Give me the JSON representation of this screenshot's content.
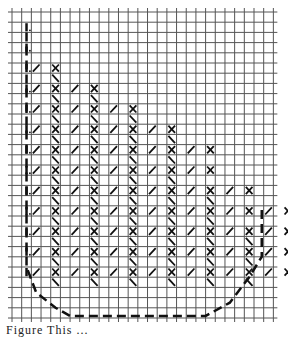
{
  "diagram": {
    "type": "needlepoint-stitch-chart",
    "grid": {
      "origin_x": 12,
      "origin_y": 12,
      "cell_w": 9.68,
      "cell_h": 10.2,
      "cols": 27,
      "rows": 30,
      "line_color": "#555555",
      "background": "#ffffff"
    },
    "stitch_color": "#111111",
    "dash_color": "#111111",
    "stitch_rows": [
      {
        "row": 5,
        "pattern": "/X",
        "start_col": 2,
        "pairs": 1
      },
      {
        "row": 6,
        "pattern": "\\",
        "cols": [
          4
        ]
      },
      {
        "row": 7,
        "pattern": "/X",
        "start_col": 2,
        "pairs": 2
      },
      {
        "row": 8,
        "pattern": "\\",
        "cols": [
          4,
          8
        ]
      },
      {
        "row": 9,
        "pattern": "/X",
        "start_col": 2,
        "pairs": 3
      },
      {
        "row": 10,
        "pattern": "\\",
        "cols": [
          4,
          8,
          12
        ]
      },
      {
        "row": 11,
        "pattern": "/X",
        "start_col": 2,
        "pairs": 4
      },
      {
        "row": 12,
        "pattern": "\\",
        "cols": [
          4,
          8,
          12,
          16
        ]
      },
      {
        "row": 13,
        "pattern": "/X",
        "start_col": 2,
        "pairs": 5
      },
      {
        "row": 14,
        "pattern": "\\",
        "cols": [
          4,
          8,
          12,
          16
        ]
      },
      {
        "row": 15,
        "pattern": "/X",
        "start_col": 2,
        "pairs": 5
      },
      {
        "row": 16,
        "pattern": "\\",
        "cols": [
          4,
          8,
          12,
          16
        ]
      },
      {
        "row": 17,
        "pattern": "/X",
        "start_col": 2,
        "pairs": 6
      },
      {
        "row": 18,
        "pattern": "\\",
        "cols": [
          4,
          8,
          12,
          16,
          20
        ]
      },
      {
        "row": 19,
        "pattern": "/X",
        "start_col": 2,
        "pairs": 7
      },
      {
        "row": 20,
        "pattern": "\\",
        "cols": [
          4,
          8,
          12,
          16,
          20
        ]
      },
      {
        "row": 21,
        "pattern": "/X",
        "start_col": 2,
        "pairs": 8
      },
      {
        "row": 22,
        "pattern": "\\",
        "cols": [
          4,
          8,
          12,
          16,
          20,
          24
        ]
      },
      {
        "row": 23,
        "pattern": "/X",
        "start_col": 2,
        "pairs": 9
      },
      {
        "row": 24,
        "pattern": "\\",
        "cols": [
          4,
          8,
          12,
          16,
          20,
          24
        ]
      },
      {
        "row": 25,
        "pattern": "/X",
        "start_col": 2,
        "pairs": 9
      },
      {
        "row": 26,
        "pattern": "\\",
        "cols": [
          4,
          8,
          12,
          16,
          20,
          24
        ]
      }
    ],
    "left_edge_marks_rows": [
      1,
      3,
      5,
      7,
      9,
      11,
      13,
      15,
      17,
      19,
      21,
      23,
      25
    ],
    "dashed_outline": [
      [
        1.5,
        2
      ],
      [
        1.5,
        25
      ],
      [
        2.5,
        27.5
      ],
      [
        4.5,
        29
      ],
      [
        6,
        29.8
      ],
      [
        20,
        29.8
      ],
      [
        22.5,
        28.5
      ],
      [
        24.5,
        26
      ],
      [
        25.8,
        24
      ],
      [
        25.8,
        19
      ]
    ],
    "caption": "Figure  This  ..."
  }
}
